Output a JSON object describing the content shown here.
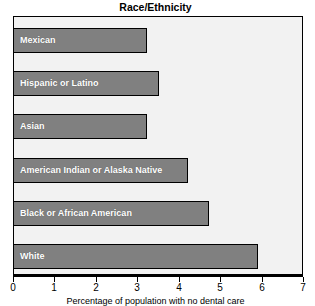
{
  "chart_data": {
    "type": "bar",
    "orientation": "horizontal",
    "title": "Race/Ethnicity",
    "xlabel": "Percentage of population with no dental care",
    "ylabel": "",
    "xlim": [
      0,
      7
    ],
    "xticks": [
      0,
      1,
      2,
      3,
      4,
      5,
      6,
      7
    ],
    "xtick_labels": [
      "0",
      "1",
      "2",
      "3",
      "4",
      "5",
      "6",
      "7"
    ],
    "grid": false,
    "legend": null,
    "categories": [
      "Mexican",
      "Hispanic or Latino",
      "Asian",
      "American Indian or Alaska Native",
      "Black or African American",
      "White"
    ],
    "values": [
      3.2,
      3.5,
      3.2,
      4.2,
      4.7,
      5.9
    ],
    "bar_color": "#808080",
    "bar_edge_color": "#000000",
    "bar_label_color": "#ffffff",
    "plot_background": "#f2f2f2",
    "axis_color": "#000000"
  }
}
